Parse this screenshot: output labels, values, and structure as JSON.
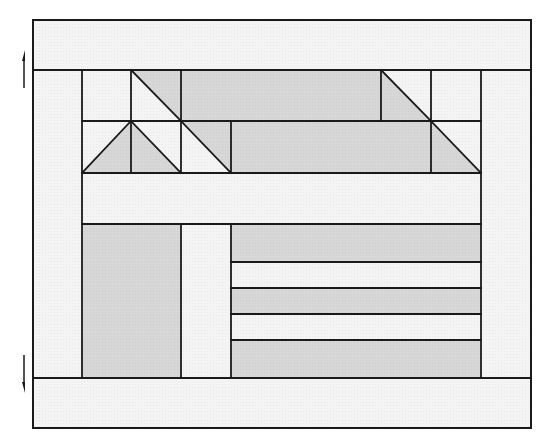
{
  "diagram": {
    "title": "Quilt block layout diagram",
    "colors": {
      "light_fabric": "#f3f3f3",
      "dark_fabric": "#d6d6d6",
      "stroke": "#1a1a1a",
      "background": "#ffffff"
    },
    "outer_border": {
      "x": 33,
      "y": 20,
      "w": 498,
      "h": 408
    },
    "inner_block": {
      "x": 82,
      "y": 70,
      "w": 399,
      "h": 308
    },
    "pieces": [
      {
        "name": "top-border-strip",
        "type": "rect",
        "x": 33,
        "y": 20,
        "w": 498,
        "h": 50,
        "fill": "light"
      },
      {
        "name": "bottom-border-strip",
        "type": "rect",
        "x": 33,
        "y": 378,
        "w": 498,
        "h": 50,
        "fill": "light"
      },
      {
        "name": "left-border-strip",
        "type": "rect",
        "x": 33,
        "y": 70,
        "w": 49,
        "h": 308,
        "fill": "light"
      },
      {
        "name": "right-border-strip",
        "type": "rect",
        "x": 481,
        "y": 70,
        "w": 50,
        "h": 308,
        "fill": "light"
      },
      {
        "name": "square-r1-c1",
        "type": "rect",
        "x": 82,
        "y": 70,
        "w": 49,
        "h": 51,
        "fill": "light"
      },
      {
        "name": "square-r1-c2-light",
        "type": "rect",
        "x": 131,
        "y": 70,
        "w": 50,
        "h": 51,
        "fill": "light"
      },
      {
        "name": "triangle-r1-c2-dark",
        "type": "poly",
        "points": "131,70 181,70 181,121",
        "fill": "dark"
      },
      {
        "name": "rect-r1-wide-dark",
        "type": "rect",
        "x": 181,
        "y": 70,
        "w": 200,
        "h": 51,
        "fill": "dark"
      },
      {
        "name": "square-r1-c6-light",
        "type": "rect",
        "x": 381,
        "y": 70,
        "w": 50,
        "h": 51,
        "fill": "light"
      },
      {
        "name": "triangle-r1-c6-dark",
        "type": "poly",
        "points": "381,70 381,121 431,121",
        "fill": "dark"
      },
      {
        "name": "square-r1-c7",
        "type": "rect",
        "x": 431,
        "y": 70,
        "w": 50,
        "h": 51,
        "fill": "light"
      },
      {
        "name": "square-r2-c1-light",
        "type": "rect",
        "x": 82,
        "y": 121,
        "w": 49,
        "h": 52,
        "fill": "light"
      },
      {
        "name": "triangle-r2-c1-dark",
        "type": "poly",
        "points": "131,121 131,173 82,173",
        "fill": "dark"
      },
      {
        "name": "square-r2-c2-light",
        "type": "rect",
        "x": 131,
        "y": 121,
        "w": 50,
        "h": 52,
        "fill": "light"
      },
      {
        "name": "triangle-r2-c2-dark",
        "type": "poly",
        "points": "131,121 181,173 131,173",
        "fill": "dark"
      },
      {
        "name": "square-r2-c3-light",
        "type": "rect",
        "x": 181,
        "y": 121,
        "w": 50,
        "h": 52,
        "fill": "light"
      },
      {
        "name": "triangle-r2-c3-dark",
        "type": "poly",
        "points": "181,121 231,121 231,173",
        "fill": "dark"
      },
      {
        "name": "rect-r2-wide-dark",
        "type": "rect",
        "x": 231,
        "y": 121,
        "w": 200,
        "h": 52,
        "fill": "dark"
      },
      {
        "name": "square-r2-c7-light",
        "type": "rect",
        "x": 431,
        "y": 121,
        "w": 50,
        "h": 52,
        "fill": "light"
      },
      {
        "name": "triangle-r2-c7-dark",
        "type": "poly",
        "points": "431,121 481,173 431,173",
        "fill": "dark"
      },
      {
        "name": "sash-strip-middle",
        "type": "rect",
        "x": 82,
        "y": 173,
        "w": 399,
        "h": 51,
        "fill": "light"
      },
      {
        "name": "tall-rect-dark",
        "type": "rect",
        "x": 82,
        "y": 224,
        "w": 99,
        "h": 154,
        "fill": "dark"
      },
      {
        "name": "tall-strip-light",
        "type": "rect",
        "x": 181,
        "y": 224,
        "w": 50,
        "h": 154,
        "fill": "light"
      },
      {
        "name": "stripe-1-dark",
        "type": "rect",
        "x": 231,
        "y": 224,
        "w": 250,
        "h": 38,
        "fill": "dark"
      },
      {
        "name": "stripe-2-light",
        "type": "rect",
        "x": 231,
        "y": 262,
        "w": 250,
        "h": 26,
        "fill": "light"
      },
      {
        "name": "stripe-3-dark",
        "type": "rect",
        "x": 231,
        "y": 288,
        "w": 250,
        "h": 26,
        "fill": "dark"
      },
      {
        "name": "stripe-4-light",
        "type": "rect",
        "x": 231,
        "y": 314,
        "w": 250,
        "h": 26,
        "fill": "light"
      },
      {
        "name": "stripe-5-dark",
        "type": "rect",
        "x": 231,
        "y": 340,
        "w": 250,
        "h": 38,
        "fill": "dark"
      }
    ],
    "lines": [
      {
        "name": "diag-r1-c2",
        "x1": 131,
        "y1": 70,
        "x2": 181,
        "y2": 121
      },
      {
        "name": "diag-r1-c6",
        "x1": 381,
        "y1": 70,
        "x2": 431,
        "y2": 121
      },
      {
        "name": "diag-r2-c1",
        "x1": 131,
        "y1": 121,
        "x2": 82,
        "y2": 173
      },
      {
        "name": "diag-r2-c2",
        "x1": 131,
        "y1": 121,
        "x2": 181,
        "y2": 173
      },
      {
        "name": "diag-r2-c3",
        "x1": 181,
        "y1": 121,
        "x2": 231,
        "y2": 173
      },
      {
        "name": "diag-r2-c7",
        "x1": 431,
        "y1": 121,
        "x2": 481,
        "y2": 173
      },
      {
        "name": "hline-y70",
        "x1": 33,
        "y1": 70,
        "x2": 531,
        "y2": 70
      },
      {
        "name": "hline-y121",
        "x1": 82,
        "y1": 121,
        "x2": 481,
        "y2": 121
      },
      {
        "name": "hline-y173",
        "x1": 82,
        "y1": 173,
        "x2": 481,
        "y2": 173
      },
      {
        "name": "hline-y224",
        "x1": 82,
        "y1": 224,
        "x2": 481,
        "y2": 224
      },
      {
        "name": "hline-y262",
        "x1": 231,
        "y1": 262,
        "x2": 481,
        "y2": 262
      },
      {
        "name": "hline-y288",
        "x1": 231,
        "y1": 288,
        "x2": 481,
        "y2": 288
      },
      {
        "name": "hline-y314",
        "x1": 231,
        "y1": 314,
        "x2": 481,
        "y2": 314
      },
      {
        "name": "hline-y340",
        "x1": 231,
        "y1": 340,
        "x2": 481,
        "y2": 340
      },
      {
        "name": "hline-y378",
        "x1": 33,
        "y1": 378,
        "x2": 531,
        "y2": 378
      },
      {
        "name": "vline-x82",
        "x1": 82,
        "y1": 70,
        "x2": 82,
        "y2": 378
      },
      {
        "name": "vline-x131",
        "x1": 131,
        "y1": 70,
        "x2": 131,
        "y2": 173
      },
      {
        "name": "vline-x181-top",
        "x1": 181,
        "y1": 70,
        "x2": 181,
        "y2": 173
      },
      {
        "name": "vline-x181-bottom",
        "x1": 181,
        "y1": 224,
        "x2": 181,
        "y2": 378
      },
      {
        "name": "vline-x231-top",
        "x1": 231,
        "y1": 121,
        "x2": 231,
        "y2": 173
      },
      {
        "name": "vline-x231-bottom",
        "x1": 231,
        "y1": 224,
        "x2": 231,
        "y2": 378
      },
      {
        "name": "vline-x381",
        "x1": 381,
        "y1": 70,
        "x2": 381,
        "y2": 121
      },
      {
        "name": "vline-x431",
        "x1": 431,
        "y1": 70,
        "x2": 431,
        "y2": 173
      },
      {
        "name": "vline-x481",
        "x1": 481,
        "y1": 70,
        "x2": 481,
        "y2": 378
      }
    ],
    "arrows": [
      {
        "name": "up-arrow",
        "direction": "up",
        "x": 24,
        "y1": 88,
        "y2": 50
      },
      {
        "name": "down-arrow",
        "direction": "down",
        "x": 24,
        "y1": 355,
        "y2": 393
      }
    ]
  }
}
